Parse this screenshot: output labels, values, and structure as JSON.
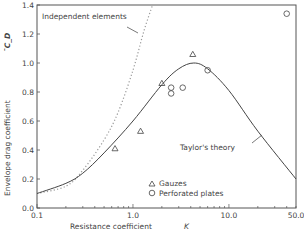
{
  "chart_data": {
    "type": "scatter",
    "title": "",
    "xlabel": "Resistance coefficient",
    "xlabel_symbol": "K",
    "ylabel": "Envelope drag coefficient",
    "ylabel_symbol": "¯C_D",
    "xscale": "log",
    "xlim": [
      0.1,
      50.0
    ],
    "ylim": [
      0.0,
      1.4
    ],
    "x_ticks": [
      "0.1",
      "1.0",
      "10.0",
      "50.0"
    ],
    "y_ticks": [
      "0.0",
      "0.2",
      "0.4",
      "0.6",
      "0.8",
      "1.0",
      "1.2",
      "1.4"
    ],
    "grid": false,
    "legend": {
      "position": "lower-middle",
      "entries": [
        "Gauzes",
        "Perforated plates"
      ]
    },
    "annotations": [
      "Independent elements",
      "Taylor's theory"
    ],
    "series": [
      {
        "name": "Gauzes",
        "marker": "triangle",
        "points": [
          [
            0.65,
            0.41
          ],
          [
            1.2,
            0.53
          ],
          [
            2.0,
            0.86
          ],
          [
            4.2,
            1.06
          ]
        ]
      },
      {
        "name": "Perforated plates",
        "marker": "circle",
        "points": [
          [
            2.5,
            0.83
          ],
          [
            2.5,
            0.79
          ],
          [
            3.3,
            0.83
          ],
          [
            6.0,
            0.95
          ],
          [
            40.0,
            1.34
          ]
        ]
      },
      {
        "name": "Taylor's theory",
        "style": "solid line",
        "points": [
          [
            0.1,
            0.1
          ],
          [
            0.2,
            0.17
          ],
          [
            0.3,
            0.24
          ],
          [
            0.5,
            0.38
          ],
          [
            1.0,
            0.6
          ],
          [
            2.0,
            0.85
          ],
          [
            3.0,
            0.96
          ],
          [
            4.3,
            1.0
          ],
          [
            6.0,
            0.96
          ],
          [
            10.0,
            0.81
          ],
          [
            20.0,
            0.53
          ],
          [
            50.0,
            0.2
          ]
        ]
      },
      {
        "name": "Independent elements",
        "style": "dotted line",
        "points": [
          [
            0.1,
            0.1
          ],
          [
            0.2,
            0.15
          ],
          [
            0.3,
            0.26
          ],
          [
            0.5,
            0.47
          ],
          [
            0.7,
            0.66
          ],
          [
            1.0,
            0.95
          ],
          [
            1.3,
            1.22
          ],
          [
            1.6,
            1.4
          ]
        ]
      }
    ]
  }
}
